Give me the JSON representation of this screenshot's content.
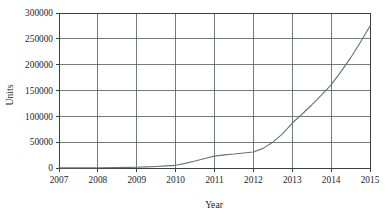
{
  "chart_data": {
    "type": "line",
    "title": "",
    "xlabel": "Year",
    "ylabel": "Units",
    "xlim": [
      2007,
      2015
    ],
    "ylim": [
      0,
      300000
    ],
    "grid": true,
    "legend": null,
    "x_tick_labels": [
      "2007",
      "2008",
      "2009",
      "2010",
      "2011",
      "2012",
      "2013",
      "2014",
      "2015"
    ],
    "x_ticks": [
      2007,
      2008,
      2009,
      2010,
      2011,
      2012,
      2013,
      2014,
      2015
    ],
    "y_tick_labels": [
      "0",
      "50000",
      "100000",
      "150000",
      "200000",
      "250000",
      "300000"
    ],
    "y_ticks": [
      0,
      50000,
      100000,
      150000,
      200000,
      250000,
      300000
    ],
    "series": [
      {
        "name": "Units",
        "color": "#6e7276",
        "x": [
          2007,
          2007.5,
          2008,
          2008.5,
          2009,
          2009.25,
          2009.5,
          2009.75,
          2010,
          2010.25,
          2010.5,
          2010.75,
          2011,
          2011.25,
          2011.5,
          2011.75,
          2012,
          2012.25,
          2012.5,
          2012.75,
          2013,
          2013.25,
          2013.5,
          2013.75,
          2014,
          2014.25,
          2014.5,
          2014.75,
          2015
        ],
        "values": [
          200,
          300,
          500,
          800,
          1500,
          2200,
          3000,
          4000,
          5200,
          9000,
          13500,
          18500,
          23000,
          25500,
          27000,
          29000,
          31000,
          38000,
          50000,
          66000,
          87000,
          104000,
          122000,
          141000,
          161000,
          186000,
          213000,
          243000,
          275000
        ]
      }
    ]
  },
  "axes": {
    "y_axis_title": "Units",
    "x_axis_title": "Year"
  }
}
